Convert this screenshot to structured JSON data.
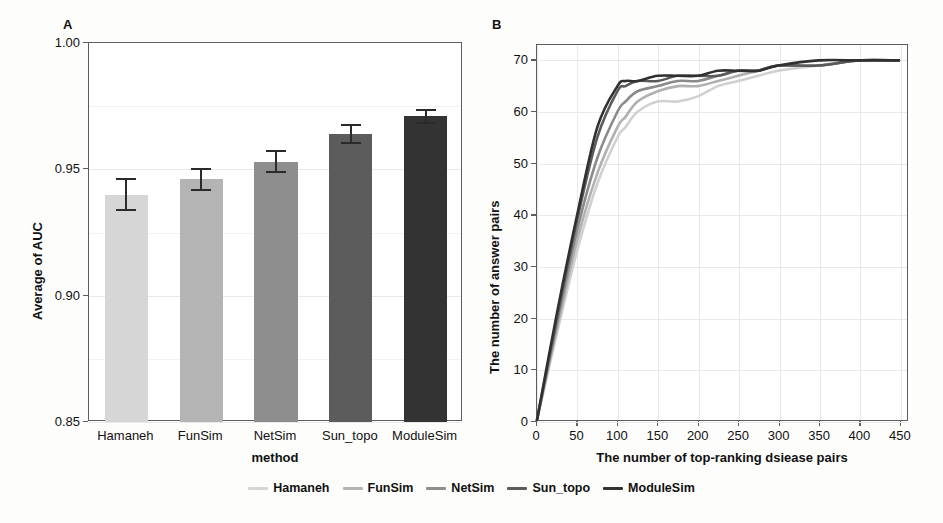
{
  "figure": {
    "panel_a_label": "A",
    "panel_b_label": "B"
  },
  "legend": {
    "position": "bottom-center",
    "items": [
      {
        "label": "Hamaneh",
        "color": "#d6d6d6"
      },
      {
        "label": "FunSim",
        "color": "#b4b4b4"
      },
      {
        "label": "NetSim",
        "color": "#8e8e8e"
      },
      {
        "label": "Sun_topo",
        "color": "#5c5c5c"
      },
      {
        "label": "ModuleSim",
        "color": "#333333"
      }
    ]
  },
  "chart_data": [
    {
      "id": "panel-a",
      "type": "bar",
      "title": "A",
      "xlabel": "method",
      "ylabel": "Average of AUC",
      "ylim": [
        0.85,
        1.0
      ],
      "yticks": [
        0.85,
        0.9,
        0.95,
        1.0
      ],
      "ytick_labels": [
        "0.85",
        "0.90",
        "0.95",
        "1.00"
      ],
      "grid": true,
      "categories": [
        "Hamaneh",
        "FunSim",
        "NetSim",
        "Sun_topo",
        "ModuleSim"
      ],
      "values": [
        0.94,
        0.946,
        0.953,
        0.964,
        0.971
      ],
      "errors": [
        0.0065,
        0.0045,
        0.0045,
        0.004,
        0.003
      ],
      "colors": [
        "#d6d6d6",
        "#b4b4b4",
        "#8e8e8e",
        "#5c5c5c",
        "#333333"
      ]
    },
    {
      "id": "panel-b",
      "type": "line",
      "title": "B",
      "xlabel": "The number of top-ranking dsiease pairs",
      "ylabel": "The number of answer pairs",
      "xlim": [
        0,
        460
      ],
      "ylim": [
        0,
        73
      ],
      "xticks": [
        0,
        50,
        100,
        150,
        200,
        250,
        300,
        350,
        400,
        450
      ],
      "xtick_labels": [
        "0",
        "50",
        "100",
        "150",
        "200",
        "250",
        "300",
        "350",
        "400",
        "450"
      ],
      "yticks": [
        0,
        10,
        20,
        30,
        40,
        50,
        60,
        70
      ],
      "ytick_labels": [
        "0",
        "10",
        "20",
        "30",
        "40",
        "50",
        "60",
        "70"
      ],
      "grid": true,
      "x": [
        0,
        25,
        50,
        75,
        100,
        110,
        125,
        150,
        175,
        200,
        225,
        250,
        275,
        300,
        350,
        400,
        450
      ],
      "series": [
        {
          "name": "Hamaneh",
          "color": "#d0d0d0",
          "values": [
            0,
            17,
            33,
            46,
            55,
            57,
            60,
            62,
            62,
            63,
            65,
            66,
            67,
            68,
            69,
            70,
            70
          ]
        },
        {
          "name": "FunSim",
          "color": "#b0b0b0",
          "values": [
            0,
            18,
            35,
            48,
            57,
            59,
            62,
            64,
            65,
            65,
            66,
            67,
            68,
            69,
            69,
            70,
            70
          ]
        },
        {
          "name": "NetSim",
          "color": "#8a8a8a",
          "values": [
            0,
            19,
            37,
            51,
            60,
            62,
            64,
            65,
            66,
            66,
            67,
            68,
            68,
            69,
            69,
            70,
            70
          ]
        },
        {
          "name": "Sun_topo",
          "color": "#5a5a5a",
          "values": [
            0,
            20,
            39,
            55,
            64,
            65,
            66,
            66,
            67,
            67,
            67,
            68,
            68,
            69,
            69,
            70,
            70
          ]
        },
        {
          "name": "ModuleSim",
          "color": "#303030",
          "values": [
            0,
            21,
            40,
            57,
            65,
            66,
            66,
            67,
            67,
            67,
            68,
            68,
            68,
            69,
            70,
            70,
            70
          ]
        }
      ]
    }
  ]
}
